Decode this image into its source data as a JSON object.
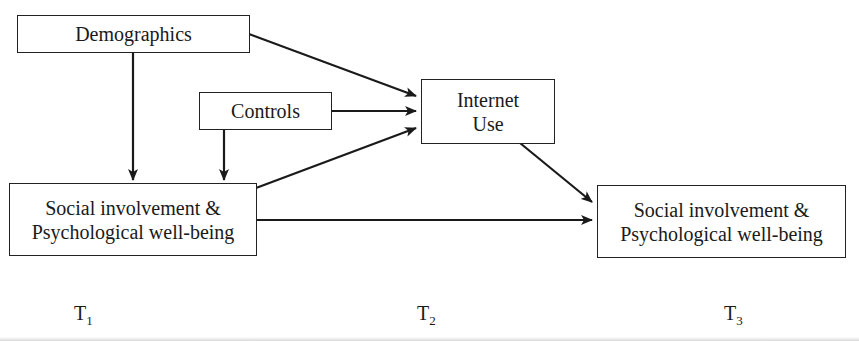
{
  "diagram": {
    "nodes": {
      "demographics": {
        "label": "Demographics"
      },
      "controls": {
        "label": "Controls"
      },
      "internet_use": {
        "line1": "Internet",
        "line2": "Use"
      },
      "social_t1": {
        "line1": "Social involvement &",
        "line2": "Psychological well-being"
      },
      "social_t3": {
        "line1": "Social involvement &",
        "line2": "Psychological well-being"
      }
    },
    "edges": [
      {
        "from": "Demographics",
        "to": "Internet Use"
      },
      {
        "from": "Demographics",
        "to": "Social involvement & Psychological well-being (T1)"
      },
      {
        "from": "Controls",
        "to": "Internet Use"
      },
      {
        "from": "Controls",
        "to": "Social involvement & Psychological well-being (T1)"
      },
      {
        "from": "Social involvement & Psychological well-being (T1)",
        "to": "Internet Use"
      },
      {
        "from": "Social involvement & Psychological well-being (T1)",
        "to": "Social involvement & Psychological well-being (T3)"
      },
      {
        "from": "Internet Use",
        "to": "Social involvement & Psychological well-being (T3)"
      }
    ],
    "time_labels": [
      {
        "base": "T",
        "sub": "1"
      },
      {
        "base": "T",
        "sub": "2"
      },
      {
        "base": "T",
        "sub": "3"
      }
    ],
    "colors": {
      "stroke": "#222222",
      "background": "#ffffff"
    }
  }
}
